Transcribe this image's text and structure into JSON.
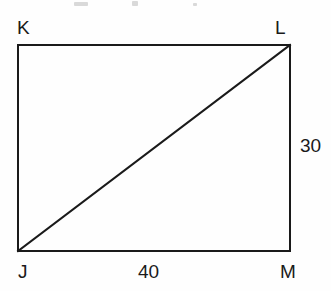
{
  "figure": {
    "kind": "geometry-diagram",
    "shape": "rectangle-with-diagonal",
    "background_color": "#fefefe",
    "stroke_color": "#1a1a1a",
    "stroke_width": 2,
    "vertices": [
      {
        "name": "K",
        "label": "K",
        "x": 18,
        "y": 45,
        "position": "top-left"
      },
      {
        "name": "L",
        "label": "L",
        "x": 290,
        "y": 45,
        "position": "top-right"
      },
      {
        "name": "M",
        "label": "M",
        "x": 290,
        "y": 251,
        "position": "bottom-right"
      },
      {
        "name": "J",
        "label": "J",
        "x": 18,
        "y": 251,
        "position": "bottom-left"
      }
    ],
    "diagonal": {
      "from": "J",
      "to": "L"
    },
    "measurements": [
      {
        "side": "JM",
        "label": "40",
        "value": 40,
        "placement": "below-bottom-edge"
      },
      {
        "side": "LM",
        "label": "30",
        "value": 30,
        "placement": "right-of-right-edge"
      }
    ]
  }
}
